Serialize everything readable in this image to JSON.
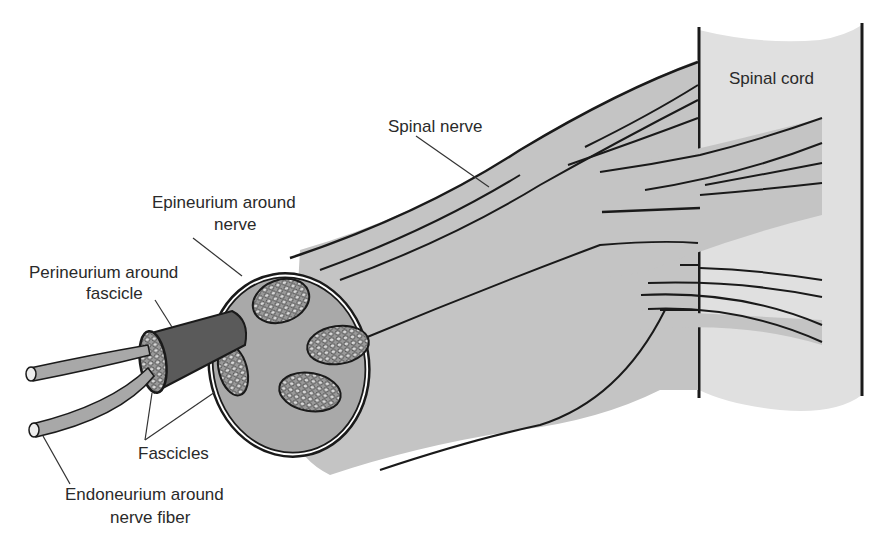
{
  "colors": {
    "background": "#ffffff",
    "outline": "#1a1a1a",
    "nerve_fill": "#c4c4c4",
    "cord_fill": "#e0e0e0",
    "cross_section_fill": "#a9a9a9",
    "perineurium_fill": "#5a5a5a",
    "fascicle_fill": "#8f8f8f",
    "fiber_fill": "#a8a8a8",
    "leader_line": "#333333",
    "text": "#2a2a2a"
  },
  "labels": {
    "spinal_cord": "Spinal cord",
    "spinal_nerve": "Spinal nerve",
    "epineurium_line1": "Epineurium around",
    "epineurium_line2": "nerve",
    "perineurium_line1": "Perineurium around",
    "perineurium_line2": "fascicle",
    "fascicles": "Fascicles",
    "endoneurium_line1": "Endoneurium around",
    "endoneurium_line2": "nerve fiber"
  },
  "structures": [
    {
      "name": "spinal-cord",
      "label_key": "spinal_cord"
    },
    {
      "name": "spinal-nerve",
      "label_key": "spinal_nerve"
    },
    {
      "name": "epineurium",
      "label_key": "epineurium_line1"
    },
    {
      "name": "perineurium",
      "label_key": "perineurium_line1"
    },
    {
      "name": "fascicles",
      "label_key": "fascicles"
    },
    {
      "name": "endoneurium",
      "label_key": "endoneurium_line1"
    }
  ]
}
